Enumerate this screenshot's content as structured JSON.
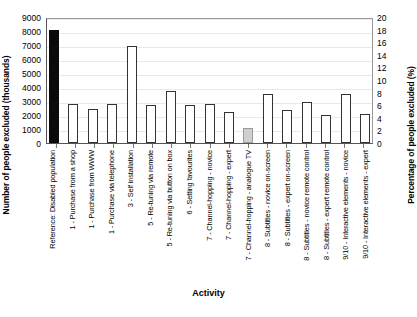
{
  "chart_data": {
    "type": "bar",
    "title": "",
    "xlabel": "Activity",
    "ylabel": "Number of people excluded (thousands)",
    "ylabel_secondary": "Percentage of people excluded (%)",
    "ylim": [
      0,
      9000
    ],
    "ylim_secondary": [
      0,
      20
    ],
    "yticks": [
      9000,
      8000,
      7000,
      6000,
      5000,
      4000,
      3000,
      2000,
      1000,
      0
    ],
    "yticks_secondary": [
      20,
      18,
      16,
      14,
      12,
      10,
      8,
      6,
      4,
      2,
      0
    ],
    "grid": true,
    "legend": "none",
    "categories": [
      "Reference: Disabled population",
      "1 - Purchase from a shop",
      "1 - Purchase from WWW",
      "1 - Purchase via telephone",
      "3 - Self installation",
      "5 - Re-tuning via remote",
      "5 - Re-tuning via button on box",
      "6 - Setting favourites",
      "7 - Channel-hopping - novice",
      "7 - Channel-hopping - expert",
      "7 - Channel-hopping - analogue TV",
      "8 - Subtitles - novice on-screen",
      "8 - Subtitles - expert on-screen",
      "8 - Subtitles - novice remote control",
      "8 - Subtitles - expert remote control",
      "9/10 - Interactive elements - novice",
      "9/10 - Interactive elements - expert"
    ],
    "values": [
      8100,
      2800,
      2450,
      2800,
      6950,
      2700,
      3700,
      2700,
      2800,
      2250,
      1050,
      3500,
      2350,
      2900,
      2000,
      3500,
      2100
    ],
    "values_percent": [
      18.0,
      6.2,
      5.4,
      6.2,
      15.4,
      6.0,
      8.2,
      6.0,
      6.2,
      5.0,
      2.3,
      7.8,
      5.2,
      6.4,
      4.4,
      7.8,
      4.7
    ],
    "bar_styles": [
      "filled",
      "hollow",
      "hollow",
      "hollow",
      "hollow",
      "hollow",
      "hollow",
      "hollow",
      "hollow",
      "hollow",
      "gray",
      "hollow",
      "hollow",
      "hollow",
      "hollow",
      "hollow",
      "hollow"
    ],
    "colors": {
      "reference_bar": "#0b0b0b",
      "standard_bar": "#ffffff",
      "highlight_bar": "#cfcfcf",
      "bar_outline": "#333333",
      "gridline": "#e9e9e9",
      "axis": "#555555"
    }
  }
}
